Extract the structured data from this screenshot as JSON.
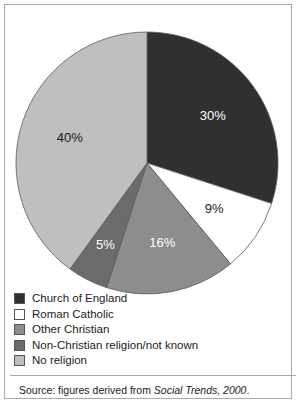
{
  "chart_data": {
    "type": "pie",
    "title": "",
    "subtitle": "",
    "xlabel": "",
    "ylabel": "",
    "legend_position": "bottom-left",
    "start_angle_deg": 0,
    "direction": "clockwise",
    "categories": [
      "Church of England",
      "Roman Catholic",
      "Other Christian",
      "Non-Christian religion/not known",
      "No religion"
    ],
    "values": [
      30,
      9,
      16,
      5,
      40
    ],
    "unit": "%",
    "data_labels": [
      "30%",
      "9%",
      "16%",
      "5%",
      "40%"
    ],
    "colors": [
      "#303030",
      "#ffffff",
      "#8d8d8d",
      "#6b6b6b",
      "#bfbfbf"
    ],
    "label_colors": [
      "#ffffff",
      "#1b1b1b",
      "#ffffff",
      "#ffffff",
      "#1b1b1b"
    ],
    "slices": [
      {
        "label": "Church of England",
        "value": 30,
        "data_label": "30%",
        "color": "#303030",
        "label_color": "#ffffff"
      },
      {
        "label": "Roman Catholic",
        "value": 9,
        "data_label": "9%",
        "color": "#ffffff",
        "label_color": "#1b1b1b"
      },
      {
        "label": "Other Christian",
        "value": 16,
        "data_label": "16%",
        "color": "#8d8d8d",
        "label_color": "#ffffff"
      },
      {
        "label": "Non-Christian religion/not known",
        "value": 5,
        "data_label": "5%",
        "color": "#6b6b6b",
        "label_color": "#ffffff"
      },
      {
        "label": "No religion",
        "value": 40,
        "data_label": "40%",
        "color": "#bfbfbf",
        "label_color": "#1b1b1b"
      }
    ]
  },
  "legend": {
    "items": [
      {
        "label": "Church of England",
        "color": "#303030"
      },
      {
        "label": "Roman Catholic",
        "color": "#ffffff"
      },
      {
        "label": "Other Christian",
        "color": "#8d8d8d"
      },
      {
        "label": "Non-Christian religion/not known",
        "color": "#6b6b6b"
      },
      {
        "label": "No religion",
        "color": "#bfbfbf"
      }
    ]
  },
  "source": {
    "prefix": "Source: figures derived from ",
    "italic": "Social Trends, 2000",
    "suffix": "."
  }
}
